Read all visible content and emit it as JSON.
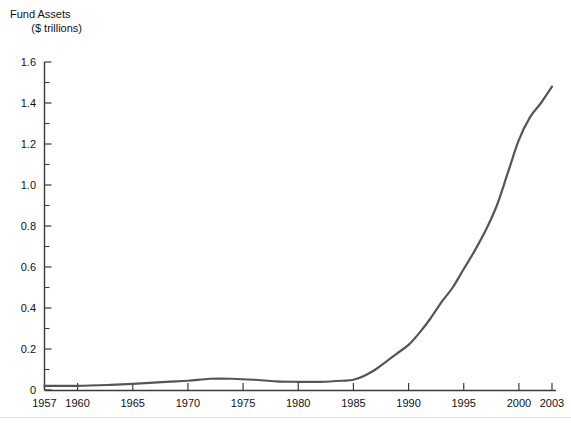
{
  "chart_data": {
    "type": "line",
    "title": "",
    "ylabel_line1": "Fund Assets",
    "ylabel_line2": "($ trillions)",
    "xlabel": "",
    "xlim": [
      1957,
      2003
    ],
    "ylim": [
      0,
      1.6
    ],
    "grid": false,
    "legend": "none",
    "y_ticks_major": [
      "0",
      "0.2",
      "0.4",
      "0.6",
      "0.8",
      "1.0",
      "1.2",
      "1.4",
      "1.6"
    ],
    "y_tick_values_major": [
      0,
      0.2,
      0.4,
      0.6,
      0.8,
      1.0,
      1.2,
      1.4,
      1.6
    ],
    "y_tick_values_minor": [
      0.1,
      0.3,
      0.5,
      0.7,
      0.9,
      1.1,
      1.3,
      1.5
    ],
    "x_ticks": [
      "1957",
      "1960",
      "1965",
      "1970",
      "1975",
      "1980",
      "1985",
      "1990",
      "1995",
      "2000",
      "2003"
    ],
    "x_tick_values": [
      1957,
      1960,
      1965,
      1970,
      1975,
      1980,
      1985,
      1990,
      1995,
      2000,
      2003
    ],
    "line_color": "#555555",
    "line_width": 2.2,
    "series": [
      {
        "name": "Fund Assets",
        "x": [
          1957,
          1958,
          1959,
          1960,
          1961,
          1962,
          1963,
          1964,
          1965,
          1966,
          1967,
          1968,
          1969,
          1970,
          1971,
          1972,
          1973,
          1974,
          1975,
          1976,
          1977,
          1978,
          1979,
          1980,
          1981,
          1982,
          1983,
          1984,
          1985,
          1986,
          1987,
          1988,
          1989,
          1990,
          1991,
          1992,
          1993,
          1994,
          1995,
          1996,
          1997,
          1998,
          1999,
          2000,
          2001,
          2002,
          2003
        ],
        "values": [
          0.02,
          0.02,
          0.02,
          0.02,
          0.023,
          0.022,
          0.025,
          0.029,
          0.035,
          0.036,
          0.045,
          0.053,
          0.049,
          0.048,
          0.055,
          0.06,
          0.047,
          0.036,
          0.046,
          0.052,
          0.049,
          0.046,
          0.049,
          0.059,
          0.056,
          0.077,
          0.113,
          0.137,
          0.245,
          0.424,
          0.453,
          0.472,
          0.553,
          0.567,
          0.853,
          1.1,
          1.375,
          1.477,
          1.853,
          2.161,
          2.509,
          2.82,
          3.1,
          3.28,
          3.33,
          3.35,
          3.5
        ]
      }
    ],
    "series_plotted": {
      "name": "Fund Assets",
      "note": "values read off axis in $ trillions",
      "points": [
        [
          1957,
          0.02
        ],
        [
          1960,
          0.02
        ],
        [
          1963,
          0.025
        ],
        [
          1965,
          0.03
        ],
        [
          1968,
          0.04
        ],
        [
          1970,
          0.045
        ],
        [
          1972,
          0.055
        ],
        [
          1974,
          0.055
        ],
        [
          1976,
          0.05
        ],
        [
          1978,
          0.042
        ],
        [
          1980,
          0.04
        ],
        [
          1982,
          0.04
        ],
        [
          1984,
          0.045
        ],
        [
          1985,
          0.05
        ],
        [
          1986,
          0.07
        ],
        [
          1987,
          0.1
        ],
        [
          1988,
          0.14
        ],
        [
          1989,
          0.18
        ],
        [
          1990,
          0.22
        ],
        [
          1991,
          0.28
        ],
        [
          1992,
          0.35
        ],
        [
          1993,
          0.43
        ],
        [
          1994,
          0.5
        ],
        [
          1995,
          0.59
        ],
        [
          1996,
          0.68
        ],
        [
          1997,
          0.78
        ],
        [
          1998,
          0.9
        ],
        [
          1999,
          1.06
        ],
        [
          2000,
          1.22
        ],
        [
          2001,
          1.33
        ],
        [
          2002,
          1.4
        ],
        [
          2003,
          1.48
        ]
      ]
    }
  }
}
